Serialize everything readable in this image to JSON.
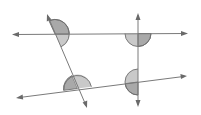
{
  "diagram": {
    "type": "parallel-lines-transversals-angles",
    "colors": {
      "background": "#ffffff",
      "line": "#7a7a7a",
      "angle_fill_dark": "#a9a9a9",
      "angle_fill_light": "#c9c9c9",
      "angle_stroke": "#6e6e6e"
    },
    "lines": [
      {
        "name": "top-line",
        "x1": 12,
        "y1": 34.5,
        "x2": 188,
        "y2": 33.5
      },
      {
        "name": "bottom-line",
        "x1": 16,
        "y1": 98,
        "x2": 187,
        "y2": 76
      },
      {
        "name": "slanted-transversal",
        "x1": 47,
        "y1": 14,
        "x2": 87,
        "y2": 108
      },
      {
        "name": "vertical-transversal",
        "x1": 138,
        "y1": 13,
        "x2": 138,
        "y2": 107
      }
    ],
    "angle_marks": [
      {
        "name": "angle-top-left",
        "cx": 55,
        "cy": 34,
        "r": 14,
        "orientation": "right"
      },
      {
        "name": "angle-top-right",
        "cx": 138,
        "cy": 33.5,
        "r": 13,
        "orientation": "below"
      },
      {
        "name": "angle-bottom-left",
        "cx": 77.5,
        "cy": 88.5,
        "r": 14,
        "orientation": "above"
      },
      {
        "name": "angle-bottom-right",
        "cx": 138,
        "cy": 82,
        "r": 13,
        "orientation": "left"
      }
    ]
  }
}
